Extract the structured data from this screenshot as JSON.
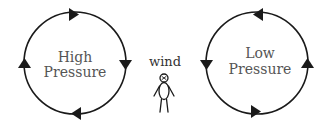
{
  "diagram": {
    "high_pressure": {
      "line1": "High",
      "line2": "Pressure",
      "rotation": "clockwise"
    },
    "low_pressure": {
      "line1": "Low",
      "line2": "Pressure",
      "rotation": "counter-clockwise"
    },
    "wind_label": "wind",
    "colors": {
      "stroke": "#1a1a1a",
      "label_text": "#555555",
      "background": "#ffffff"
    }
  }
}
